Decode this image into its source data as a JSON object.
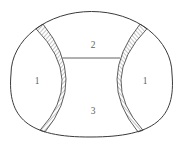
{
  "figure": {
    "regions": [
      {
        "id": "left",
        "label": "1"
      },
      {
        "id": "top-center",
        "label": "2"
      },
      {
        "id": "right",
        "label": "1"
      },
      {
        "id": "bottom-center",
        "label": "3"
      }
    ],
    "colors": {
      "stroke": "#3a3a3a",
      "label_text": "#5f5f5f",
      "background": "#ffffff"
    }
  }
}
